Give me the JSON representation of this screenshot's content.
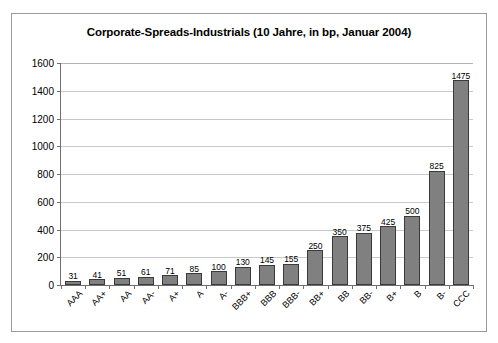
{
  "chart_data": {
    "type": "bar",
    "title": "Corporate-Spreads-Industrials (10 Jahre, in bp, Januar 2004)",
    "xlabel": "",
    "ylabel": "",
    "ylim": [
      0,
      1600
    ],
    "ytick_step": 200,
    "grid": true,
    "legend": false,
    "bar_color": "#808080",
    "bar_border_color": "#3a3a3a",
    "categories": [
      "AAA",
      "AA+",
      "AA",
      "AA-",
      "A+",
      "A",
      "A-",
      "BBB+",
      "BBB",
      "BBB-",
      "BB+",
      "BB",
      "BB-",
      "B+",
      "B",
      "B-",
      "CCC"
    ],
    "values": [
      31,
      41,
      51,
      61,
      71,
      85,
      100,
      130,
      145,
      155,
      250,
      350,
      375,
      425,
      500,
      825,
      1475
    ],
    "ytick_labels": [
      "1600",
      "1400",
      "1200",
      "1000",
      "800",
      "600",
      "400",
      "200",
      "0"
    ],
    "data_labels": [
      "31",
      "41",
      "51",
      "61",
      "71",
      "85",
      "100",
      "130",
      "145",
      "155",
      "250",
      "350",
      "375",
      "425",
      "500",
      "825",
      "1475"
    ]
  }
}
